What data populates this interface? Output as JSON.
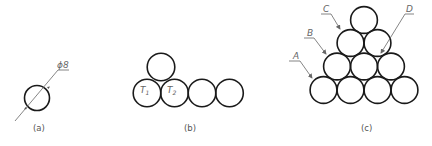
{
  "panels": [
    {
      "id": "a",
      "caption": "(a)",
      "circles": [
        {
          "cx": 37,
          "cy": 98,
          "r": 12.5
        }
      ],
      "dimension": {
        "label": "ϕ8"
      }
    },
    {
      "id": "b",
      "caption": "(b)",
      "circles": [
        {
          "cx": 161,
          "cy": 67,
          "r": 13.8
        },
        {
          "cx": 147,
          "cy": 93,
          "r": 13.8
        },
        {
          "cx": 174.5,
          "cy": 93,
          "r": 13.8
        },
        {
          "cx": 202,
          "cy": 93,
          "r": 13.8
        },
        {
          "cx": 229.5,
          "cy": 93,
          "r": 13.8
        }
      ],
      "labels": [
        {
          "text": "T",
          "sub": "1"
        },
        {
          "text": "T",
          "sub": "2"
        }
      ]
    },
    {
      "id": "c",
      "caption": "(c)",
      "circles": [
        {
          "cx": 364,
          "cy": 20,
          "r": 13.4
        },
        {
          "cx": 350.5,
          "cy": 43,
          "r": 13.4
        },
        {
          "cx": 377.5,
          "cy": 43,
          "r": 13.4
        },
        {
          "cx": 337,
          "cy": 66.5,
          "r": 13.4
        },
        {
          "cx": 364,
          "cy": 66.5,
          "r": 13.4
        },
        {
          "cx": 391,
          "cy": 66.5,
          "r": 13.4
        },
        {
          "cx": 323.5,
          "cy": 90,
          "r": 13.4
        },
        {
          "cx": 350.5,
          "cy": 90,
          "r": 13.4
        },
        {
          "cx": 377.5,
          "cy": 90,
          "r": 13.4
        },
        {
          "cx": 404.5,
          "cy": 90,
          "r": 13.4
        }
      ],
      "callouts": [
        {
          "text": "A"
        },
        {
          "text": "B"
        },
        {
          "text": "C"
        },
        {
          "text": "D"
        }
      ]
    }
  ]
}
